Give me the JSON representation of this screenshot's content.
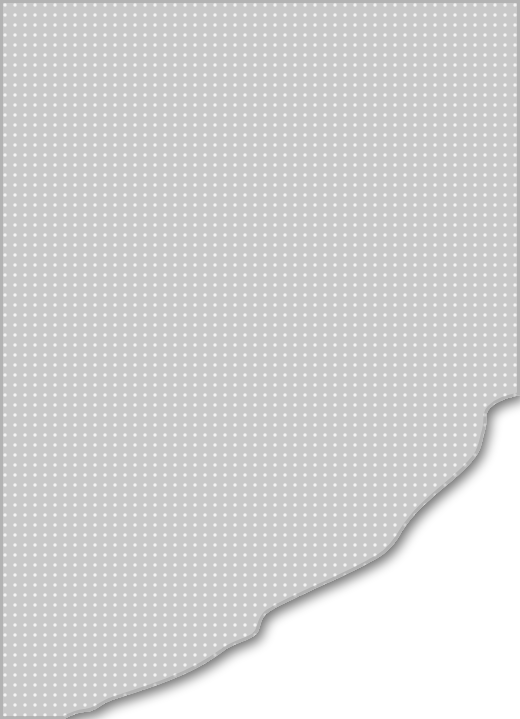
{
  "scene": {
    "description": "Torn sheet of gray polka-dot paper revealing white underneath",
    "width": 520,
    "height": 719
  },
  "colors": {
    "paper": "#c9c9c9",
    "dot": "#f4f4f4",
    "underlay": "#ffffff",
    "shadow": "#7a7a7a"
  },
  "pattern": {
    "spacing": 10,
    "offset": 5,
    "dot_radius": 1.7
  },
  "tear_edge": {
    "path": "M0,0 L520,0 L520,395 C508,398 498,400 490,408 C484,414 488,422 485,430 C482,440 482,448 476,456 C466,470 450,482 436,494 C420,508 408,520 398,538 C390,550 382,556 370,562 C352,572 334,580 312,590 C292,600 276,606 266,614 C258,622 262,630 254,636 C244,642 232,644 222,652 C206,664 190,672 170,680 C150,688 130,694 112,700 C100,704 96,712 84,712 C76,713 70,716 64,719 L0,719 Z"
  }
}
